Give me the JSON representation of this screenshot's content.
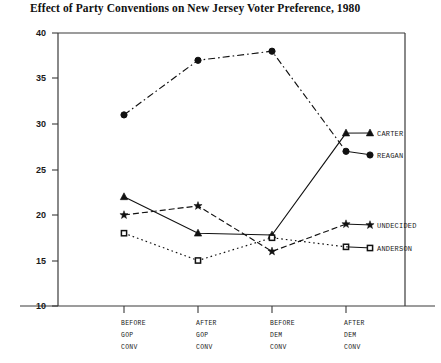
{
  "chart_data": {
    "type": "line",
    "title": "Effect of Party Conventions on New Jersey Voter Preference, 1980",
    "xlabel": "",
    "ylabel": "",
    "categories": [
      "BEFORE GOP CONV",
      "AFTER GOP CONV",
      "BEFORE DEM CONV",
      "AFTER DEM CONV"
    ],
    "category_lines": [
      [
        "BEFORE",
        "GOP",
        "CONV"
      ],
      [
        "AFTER",
        "GOP",
        "CONV"
      ],
      [
        "BEFORE",
        "DEM",
        "CONV"
      ],
      [
        "AFTER",
        "DEM",
        "CONV"
      ]
    ],
    "ylim": [
      10,
      40
    ],
    "yticks": [
      10,
      15,
      20,
      25,
      30,
      35,
      40
    ],
    "ytick_labels": [
      "10",
      "15",
      "20",
      "25",
      "30",
      "35",
      "40"
    ],
    "grid": false,
    "legend_position": "right-inline",
    "series": [
      {
        "name": "REAGAN",
        "values": [
          31,
          37,
          38,
          27
        ],
        "marker": "filled-circle",
        "dash": "dash-dot",
        "color": "#111111"
      },
      {
        "name": "CARTER",
        "values": [
          22,
          18,
          17.8,
          29
        ],
        "marker": "filled-triangle",
        "dash": "solid",
        "color": "#111111"
      },
      {
        "name": "UNDECIDED",
        "values": [
          20,
          21,
          16,
          19
        ],
        "marker": "star",
        "dash": "dashed",
        "color": "#111111"
      },
      {
        "name": "ANDERSON",
        "values": [
          18,
          15,
          17.5,
          16.5
        ],
        "marker": "open-square",
        "dash": "dotted",
        "color": "#111111"
      }
    ]
  },
  "axis": {
    "y_labels": [
      "40",
      "35",
      "30",
      "25",
      "20",
      "15",
      "10"
    ]
  },
  "legend": {
    "items": [
      {
        "label": "CARTER"
      },
      {
        "label": "REAGAN"
      },
      {
        "label": "UNDECIDED"
      },
      {
        "label": "ANDERSON"
      }
    ]
  }
}
